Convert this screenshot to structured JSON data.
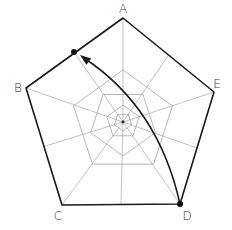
{
  "diagram": {
    "center": [
      123,
      122
    ],
    "vertices": {
      "A": {
        "label": "A",
        "point": [
          123,
          18
        ],
        "label_pos": [
          123,
          13
        ]
      },
      "B": {
        "label": "B",
        "point": [
          26,
          88
        ],
        "label_pos": [
          18,
          92
        ]
      },
      "C": {
        "label": "C",
        "point": [
          62,
          205
        ],
        "label_pos": [
          58,
          220
        ]
      },
      "D": {
        "label": "D",
        "point": [
          180,
          204
        ],
        "label_pos": [
          187,
          220
        ]
      },
      "E": {
        "label": "E",
        "point": [
          214,
          92
        ],
        "label_pos": [
          217,
          88
        ]
      }
    },
    "inner_rings": [
      {
        "radius": 52,
        "orientation": "point-up"
      },
      {
        "radius": 34,
        "orientation": "point-down"
      },
      {
        "radius": 17,
        "orientation": "point-up"
      },
      {
        "radius": 9,
        "orientation": "point-down"
      }
    ],
    "markers": [
      {
        "name": "start-dot",
        "point": [
          180,
          204
        ]
      },
      {
        "name": "end-dot",
        "point": [
          74,
          52
        ]
      }
    ],
    "arrow": {
      "from": "D",
      "to": "point on edge AB",
      "path": "M180,204 C168,150 140,95 84,58",
      "head_tip": [
        80,
        55
      ]
    },
    "colors": {
      "outline": "#1a1a1a",
      "web": "#9a9a9a",
      "background": "#ffffff"
    }
  }
}
